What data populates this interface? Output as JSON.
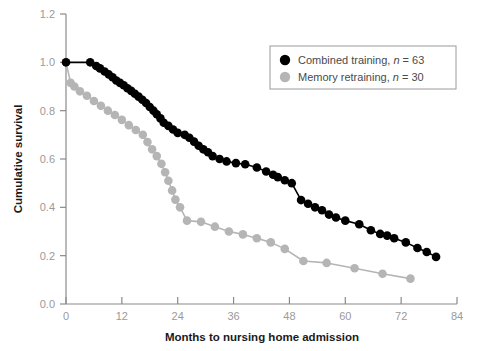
{
  "chart_data": {
    "type": "line",
    "chart_kind": "kaplan-meier-survival",
    "title": "",
    "xlabel": "Months to nursing home admission",
    "ylabel": "Cumulative survival",
    "xlim": [
      0,
      84
    ],
    "ylim": [
      0.0,
      1.2
    ],
    "xticks": [
      0,
      12,
      24,
      36,
      48,
      60,
      72,
      84
    ],
    "xtick_labels": [
      "0",
      "12",
      "24",
      "36",
      "48",
      "60",
      "72",
      "84"
    ],
    "yticks": [
      0.0,
      0.2,
      0.4,
      0.6,
      0.8,
      1.0,
      1.2
    ],
    "ytick_labels": [
      "0.0",
      "0.2",
      "0.4",
      "0.6",
      "0.8",
      "1.0",
      "1.2"
    ],
    "grid": false,
    "legend_position": "top-right",
    "series": [
      {
        "name": "Combined training",
        "n": 63,
        "legend_label": "Combined training, n = 63",
        "color": "#000000",
        "marker": "circle",
        "points": [
          [
            0.0,
            1.0
          ],
          [
            5.2,
            1.0
          ],
          [
            6.5,
            0.985
          ],
          [
            7.3,
            0.975
          ],
          [
            8.3,
            0.962
          ],
          [
            9.2,
            0.95
          ],
          [
            10.0,
            0.938
          ],
          [
            10.8,
            0.925
          ],
          [
            11.6,
            0.915
          ],
          [
            12.4,
            0.905
          ],
          [
            13.2,
            0.893
          ],
          [
            14.0,
            0.882
          ],
          [
            14.8,
            0.87
          ],
          [
            15.6,
            0.858
          ],
          [
            16.4,
            0.845
          ],
          [
            17.2,
            0.832
          ],
          [
            18.0,
            0.815
          ],
          [
            18.8,
            0.8
          ],
          [
            19.5,
            0.785
          ],
          [
            20.3,
            0.768
          ],
          [
            21.0,
            0.75
          ],
          [
            22.0,
            0.737
          ],
          [
            23.0,
            0.722
          ],
          [
            24.0,
            0.708
          ],
          [
            25.5,
            0.7
          ],
          [
            26.5,
            0.688
          ],
          [
            27.5,
            0.672
          ],
          [
            28.5,
            0.655
          ],
          [
            29.5,
            0.64
          ],
          [
            30.5,
            0.628
          ],
          [
            31.5,
            0.612
          ],
          [
            33.0,
            0.6
          ],
          [
            34.5,
            0.59
          ],
          [
            36.5,
            0.583
          ],
          [
            38.5,
            0.578
          ],
          [
            41.0,
            0.565
          ],
          [
            43.0,
            0.548
          ],
          [
            44.5,
            0.535
          ],
          [
            45.5,
            0.525
          ],
          [
            47.0,
            0.512
          ],
          [
            48.5,
            0.5
          ],
          [
            50.5,
            0.43
          ],
          [
            52.0,
            0.415
          ],
          [
            53.5,
            0.4
          ],
          [
            55.0,
            0.388
          ],
          [
            56.5,
            0.37
          ],
          [
            58.0,
            0.358
          ],
          [
            60.0,
            0.345
          ],
          [
            63.0,
            0.33
          ],
          [
            65.5,
            0.305
          ],
          [
            67.5,
            0.29
          ],
          [
            69.0,
            0.283
          ],
          [
            70.5,
            0.272
          ],
          [
            73.0,
            0.255
          ],
          [
            75.5,
            0.232
          ],
          [
            77.5,
            0.215
          ],
          [
            79.5,
            0.195
          ]
        ]
      },
      {
        "name": "Memory retraining",
        "n": 30,
        "legend_label": "Memory retraining, n = 30",
        "color": "#b5b5b5",
        "marker": "circle",
        "points": [
          [
            0.0,
            1.0
          ],
          [
            1.0,
            0.915
          ],
          [
            1.8,
            0.9
          ],
          [
            3.0,
            0.88
          ],
          [
            4.5,
            0.862
          ],
          [
            6.0,
            0.84
          ],
          [
            7.5,
            0.82
          ],
          [
            9.0,
            0.8
          ],
          [
            10.5,
            0.782
          ],
          [
            12.0,
            0.762
          ],
          [
            13.5,
            0.74
          ],
          [
            15.0,
            0.72
          ],
          [
            16.5,
            0.7
          ],
          [
            17.5,
            0.67
          ],
          [
            18.5,
            0.64
          ],
          [
            19.5,
            0.612
          ],
          [
            20.5,
            0.58
          ],
          [
            21.3,
            0.545
          ],
          [
            22.0,
            0.51
          ],
          [
            22.8,
            0.47
          ],
          [
            23.5,
            0.432
          ],
          [
            24.5,
            0.4
          ],
          [
            26.0,
            0.345
          ],
          [
            29.0,
            0.34
          ],
          [
            32.0,
            0.32
          ],
          [
            35.0,
            0.3
          ],
          [
            38.0,
            0.288
          ],
          [
            41.0,
            0.272
          ],
          [
            44.0,
            0.255
          ],
          [
            47.0,
            0.228
          ],
          [
            51.0,
            0.178
          ],
          [
            56.0,
            0.17
          ],
          [
            62.0,
            0.148
          ],
          [
            68.0,
            0.125
          ],
          [
            74.0,
            0.105
          ]
        ]
      }
    ]
  },
  "axes": {
    "ylabel": "Cumulative survival",
    "xlabel": "Months to nursing home admission"
  },
  "legend": {
    "items": [
      {
        "label": "Combined training, n = 63",
        "text_a": "Combined training, ",
        "text_n": "n",
        "text_b": " = 63",
        "color": "#000000"
      },
      {
        "label": "Memory retraining, n = 30",
        "text_a": "Memory retraining, ",
        "text_n": "n",
        "text_b": " = 30",
        "color": "#b5b5b5"
      }
    ]
  }
}
